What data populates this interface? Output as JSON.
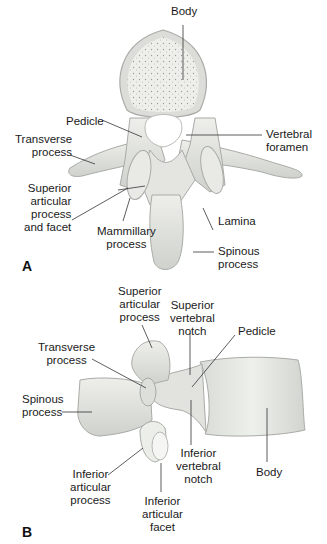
{
  "figure": {
    "panel_a": {
      "label": "A",
      "view": "superior view of lumbar vertebra",
      "labels": {
        "body": "Body",
        "pedicle": "Pedicle",
        "transverse_process": "Transverse\nprocess",
        "vertebral_foramen": "Vertebral\nforamen",
        "superior_articular_process_and_facet": "Superior\narticular\nprocess\nand facet",
        "mammillary_process": "Mammillary\nprocess",
        "lamina": "Lamina",
        "spinous_process": "Spinous\nprocess"
      }
    },
    "panel_b": {
      "label": "B",
      "view": "lateral view of lumbar vertebra",
      "labels": {
        "superior_articular_process": "Superior\narticular\nprocess",
        "superior_vertebral_notch": "Superior\nvertebral\nnotch",
        "pedicle": "Pedicle",
        "transverse_process": "Transverse\nprocess",
        "spinous_process": "Spinous\nprocess",
        "inferior_articular_process": "Inferior\narticular\nprocess",
        "inferior_vertebral_notch": "Inferior\nvertebral\nnotch",
        "body": "Body",
        "inferior_articular_facet": "Inferior\narticular\nfacet"
      }
    },
    "colors": {
      "bone": "#e6e7e3",
      "bone_shadow": "#c9cbc6",
      "bone_outline": "#a9aba6",
      "cancellous": "#d8d9d4",
      "leader_line": "#333333"
    }
  }
}
